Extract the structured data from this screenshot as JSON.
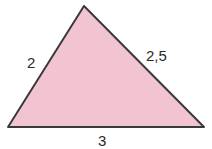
{
  "diagram": {
    "type": "triangle",
    "fill_color": "#f2c4d2",
    "stroke_color": "#3a3a3a",
    "vertices": {
      "top": [
        84,
        6
      ],
      "bottom_left": [
        8,
        127
      ],
      "bottom_right": [
        204,
        127
      ]
    },
    "sides": {
      "left": "2",
      "right": "2,5",
      "bottom": "3"
    }
  }
}
